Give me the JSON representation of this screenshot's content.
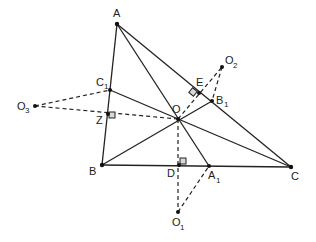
{
  "diagram": {
    "labels": {
      "A": "A",
      "B": "B",
      "C": "C",
      "O": "O",
      "C1_main": "C",
      "C1_sub": "1",
      "B1_main": "B",
      "B1_sub": "1",
      "A1_main": "A",
      "A1_sub": "1",
      "D": "D",
      "E": "E",
      "Z": "Z",
      "O1_main": "O",
      "O1_sub": "1",
      "O2_main": "O",
      "O2_sub": "2",
      "O3_main": "O",
      "O3_sub": "3"
    },
    "points": {
      "A": [
        117,
        24
      ],
      "B": [
        102,
        165
      ],
      "C": [
        291,
        167
      ],
      "O": [
        178,
        119
      ],
      "C1": [
        110,
        90
      ],
      "B1": [
        212,
        101
      ],
      "A1": [
        209,
        166
      ],
      "D": [
        179,
        165
      ],
      "E": [
        196,
        93
      ],
      "Z": [
        108,
        114
      ],
      "O1": [
        178,
        212
      ],
      "O2": [
        222,
        67
      ],
      "O3": [
        35,
        106
      ]
    }
  }
}
